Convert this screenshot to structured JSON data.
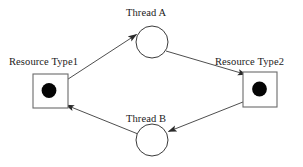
{
  "diagram": {
    "type": "resource-allocation-graph",
    "background_color": "#ffffff",
    "stroke_color": "#3a3a3a",
    "token_color": "#000000",
    "text_color": "#1a1a1a",
    "nodes": [
      {
        "id": "resource-type-1",
        "label": "Resource Type1",
        "shape": "square",
        "x": 50,
        "y": 91,
        "width": 35,
        "height": 35,
        "instances": 1,
        "label_position": "above"
      },
      {
        "id": "thread-a",
        "label": "Thread A",
        "shape": "circle",
        "x": 152,
        "y": 42,
        "radius": 16,
        "label_position": "above"
      },
      {
        "id": "resource-type-2",
        "label": "Resource Type2",
        "shape": "square",
        "x": 260,
        "y": 89,
        "width": 35,
        "height": 35,
        "instances": 1,
        "label_position": "above"
      },
      {
        "id": "thread-b",
        "label": "Thread B",
        "shape": "circle",
        "x": 152,
        "y": 140,
        "radius": 16,
        "label_position": "above"
      }
    ],
    "edges": [
      {
        "id": "edge-r1-to-a",
        "from": "resource-type-1",
        "to": "thread-a",
        "kind": "assignment",
        "arrow": true
      },
      {
        "id": "edge-a-to-r2",
        "from": "thread-a",
        "to": "resource-type-2",
        "kind": "request",
        "arrow": true
      },
      {
        "id": "edge-r2-to-b",
        "from": "resource-type-2",
        "to": "thread-b",
        "kind": "assignment",
        "arrow": true
      },
      {
        "id": "edge-b-to-r1",
        "from": "thread-b",
        "to": "resource-type-1",
        "kind": "request",
        "arrow": true
      }
    ]
  }
}
